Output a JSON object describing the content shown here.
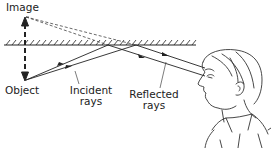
{
  "diagram": {
    "labels": {
      "image": "Image",
      "object": "Object",
      "incident_line1": "Incident",
      "incident_line2": "rays",
      "reflected_line1": "Reflected",
      "reflected_line2": "rays"
    },
    "colors": {
      "ink": "#222222",
      "background": "#ffffff"
    }
  }
}
